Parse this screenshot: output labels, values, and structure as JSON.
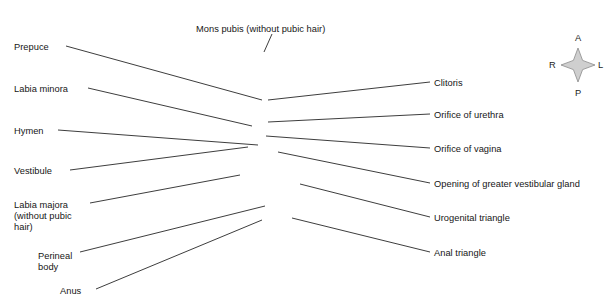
{
  "figure": {
    "type": "anatomical-illustration",
    "style": "grayscale airbrush medical illustration on white background",
    "width": 612,
    "height": 306,
    "line_color": "#1a1a1a",
    "text_color": "#161616",
    "background_color": "#ffffff"
  },
  "labels": {
    "top": [
      {
        "id": "mons-pubis",
        "text": "Mons pubis (without pubic hair)",
        "x": 196,
        "y": 24,
        "side": "top"
      }
    ],
    "left": [
      {
        "id": "prepuce",
        "text": "Prepuce",
        "x": 14,
        "y": 42,
        "lines": [
          "Prepuce"
        ]
      },
      {
        "id": "labia-minora",
        "text": "Labia minora",
        "x": 14,
        "y": 84,
        "lines": [
          "Labia minora"
        ]
      },
      {
        "id": "hymen",
        "text": "Hymen",
        "x": 14,
        "y": 126,
        "lines": [
          "Hymen"
        ]
      },
      {
        "id": "vestibule",
        "text": "Vestibule",
        "x": 14,
        "y": 166,
        "lines": [
          "Vestibule"
        ]
      },
      {
        "id": "labia-majora",
        "text": "Labia majora (without pubic hair)",
        "x": 14,
        "y": 200,
        "lines": [
          "Labia majora",
          "(without pubic",
          "hair)"
        ]
      },
      {
        "id": "perineal-body",
        "text": "Perineal body",
        "x": 38,
        "y": 251,
        "lines": [
          "Perineal",
          "body"
        ]
      },
      {
        "id": "anus",
        "text": "Anus",
        "x": 60,
        "y": 286,
        "lines": [
          "Anus"
        ]
      }
    ],
    "right": [
      {
        "id": "clitoris",
        "text": "Clitoris",
        "x": 434,
        "y": 78
      },
      {
        "id": "orifice-urethra",
        "text": "Orifice of urethra",
        "x": 434,
        "y": 110
      },
      {
        "id": "orifice-vagina",
        "text": "Orifice of vagina",
        "x": 434,
        "y": 144
      },
      {
        "id": "greater-vestibular",
        "text": "Opening of greater vestibular gland",
        "x": 434,
        "y": 179
      },
      {
        "id": "urogenital-triangle",
        "text": "Urogenital triangle",
        "x": 434,
        "y": 213
      },
      {
        "id": "anal-triangle",
        "text": "Anal triangle",
        "x": 434,
        "y": 248
      }
    ]
  },
  "leaders": {
    "top": [
      {
        "id": "mons-pubis-leader",
        "x1": 272,
        "y1": 34,
        "x2": 264,
        "y2": 52
      }
    ],
    "left": [
      {
        "id": "prepuce-leader",
        "x1": 66,
        "y1": 46,
        "x2": 262,
        "y2": 100
      },
      {
        "id": "labia-minora-leader",
        "x1": 88,
        "y1": 88,
        "x2": 252,
        "y2": 126
      },
      {
        "id": "hymen-leader",
        "x1": 58,
        "y1": 130,
        "x2": 258,
        "y2": 145
      },
      {
        "id": "vestibule-leader",
        "x1": 70,
        "y1": 170,
        "x2": 248,
        "y2": 147
      },
      {
        "id": "labia-majora-leader",
        "x1": 90,
        "y1": 203,
        "x2": 240,
        "y2": 175
      },
      {
        "id": "perineal-body-leader",
        "x1": 80,
        "y1": 252,
        "x2": 265,
        "y2": 206
      },
      {
        "id": "anus-leader",
        "x1": 96,
        "y1": 289,
        "x2": 262,
        "y2": 220
      }
    ],
    "right": [
      {
        "id": "clitoris-leader",
        "x1": 430,
        "y1": 82,
        "x2": 268,
        "y2": 100
      },
      {
        "id": "orifice-urethra-leader",
        "x1": 430,
        "y1": 114,
        "x2": 268,
        "y2": 122
      },
      {
        "id": "orifice-vagina-leader",
        "x1": 430,
        "y1": 148,
        "x2": 266,
        "y2": 136
      },
      {
        "id": "greater-vestibular-leader",
        "x1": 430,
        "y1": 183,
        "x2": 278,
        "y2": 152
      },
      {
        "id": "urogenital-triangle-leader",
        "x1": 430,
        "y1": 217,
        "x2": 300,
        "y2": 184
      },
      {
        "id": "anal-triangle-leader",
        "x1": 430,
        "y1": 252,
        "x2": 292,
        "y2": 218
      }
    ]
  },
  "compass": {
    "center_x": 578,
    "center_y": 65,
    "anterior": {
      "letter": "A",
      "x": 575,
      "y": 33
    },
    "posterior": {
      "letter": "P",
      "x": 575,
      "y": 88
    },
    "right": {
      "letter": "R",
      "x": 549,
      "y": 60
    },
    "left": {
      "letter": "L",
      "x": 598,
      "y": 60
    }
  }
}
